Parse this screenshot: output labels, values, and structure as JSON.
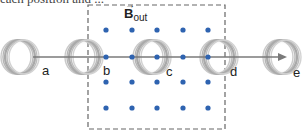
{
  "caption_fragment": "each position and ...",
  "field": {
    "symbol": "B",
    "subscript": "out",
    "vector_arrow": "→",
    "dot_color": "#2e63b0",
    "dots": {
      "columns_x": [
        106,
        132,
        157,
        183,
        208
      ],
      "rows_y": [
        30,
        57,
        82,
        108
      ]
    },
    "region": {
      "left": 88,
      "top": 5,
      "right": 225,
      "bottom": 129,
      "border": "dashed",
      "color": "#666666"
    }
  },
  "path": {
    "y": 57,
    "x_start": 33,
    "x_end": 286,
    "color": "#7a7a7a",
    "arrow": "right"
  },
  "positions": [
    {
      "label": "a",
      "coil_x": 20,
      "label_x": 42,
      "label_y": 64
    },
    {
      "label": "b",
      "coil_x": 84,
      "label_x": 103,
      "label_y": 64
    },
    {
      "label": "c",
      "coil_x": 152,
      "label_x": 166,
      "label_y": 65
    },
    {
      "label": "d",
      "coil_x": 219,
      "label_x": 230,
      "label_y": 65
    },
    {
      "label": "e",
      "coil_x": 282,
      "label_x": 293,
      "label_y": 66
    }
  ]
}
